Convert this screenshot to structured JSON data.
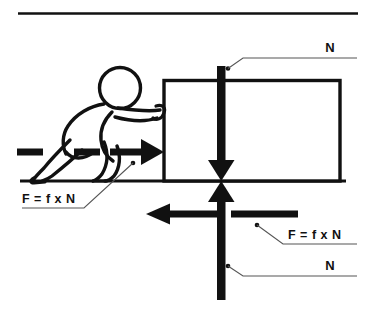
{
  "diagram": {
    "colors": {
      "ink": "#111111",
      "background": "#ffffff",
      "leader": "#5a5a5a"
    },
    "top_rule": {
      "name": "top-divider-rule"
    },
    "ground": {
      "name": "ground-line"
    },
    "block": {
      "name": "block-rectangle"
    },
    "person": {
      "name": "person-pushing"
    },
    "labels": {
      "normal_top": "N",
      "normal_bottom": "N",
      "friction_left": "F = f x N",
      "friction_right": "F = f x N"
    },
    "arrows": {
      "push_right": "push-force-arrow-right",
      "friction_left": "friction-force-arrow-left",
      "normal_down": "normal-force-arrow-down",
      "normal_up": "normal-force-arrow-up",
      "dash_left_small": "push-force-dash-segment",
      "dash_left_mid": "push-force-dash-segment",
      "dash_right_bar": "friction-force-dash-segment"
    }
  }
}
